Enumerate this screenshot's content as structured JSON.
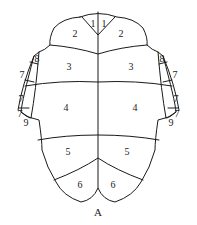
{
  "figure": {
    "caption": "A",
    "stroke_color": "#1a1a1a",
    "background": "#ffffff"
  },
  "labels": {
    "left": {
      "s1": "1",
      "s2": "2",
      "s3": "3",
      "s4": "4",
      "s5": "5",
      "s6": "6",
      "s7a": "7",
      "s7b": "7",
      "s7c": "7",
      "s8": "8",
      "s9": "9"
    },
    "right": {
      "s1": "1",
      "s2": "2",
      "s3": "3",
      "s4": "4",
      "s5": "5",
      "s6": "6",
      "s7a": "7",
      "s7b": "7",
      "s7c": "7",
      "s8": "8",
      "s9": "9"
    }
  }
}
